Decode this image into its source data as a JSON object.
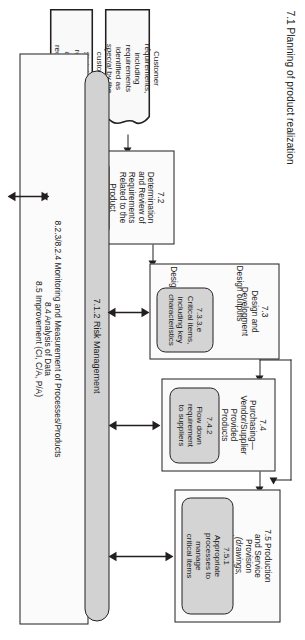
{
  "diagram": {
    "title": "7.1 Planning of product realization",
    "orientation": "rotated-90-clockwise",
    "stages": {
      "design_inputs_label": "Design inputs",
      "design_outputs_label": "Design outputs"
    },
    "boxes": {
      "production": {
        "id": "7.5",
        "title_line1": "7.5 Production",
        "title_line2": "and Service",
        "title_line3": "Provision",
        "note_line1": "(drawings,",
        "note_line2": "instructions,",
        "note_line3": "plans, etc.)",
        "inner": {
          "id": "7.5.1",
          "line1": "Appropriate",
          "line2": "processes to",
          "line3": "manage",
          "line4": "critical items"
        }
      },
      "purchasing": {
        "id": "7.4",
        "title_line1": "7.4",
        "title_line2": "Purchasing—",
        "title_line3": "Vendor/Supplier",
        "title_line4": "Provided",
        "title_line5": "Products",
        "inner": {
          "id": "7.4.2",
          "line1": "Flow down",
          "line2": "requirement",
          "line3": "to suppliers"
        }
      },
      "design": {
        "id": "7.3",
        "title_line1": "7.3",
        "title_line2": "Design and",
        "title_line3": "Development",
        "inner": {
          "id": "7.3.3.e",
          "line1": "Critical items,",
          "line2": "including key",
          "line3": "characteristics"
        }
      },
      "requirements": {
        "id": "7.2",
        "title_line1": "7.2",
        "title_line2": "Determination",
        "title_line3": "and Review of",
        "title_line4": "Requirements",
        "title_line5": "Related to the",
        "title_line6": "Product",
        "inner": {
          "line1": "Special",
          "line2": "requirements",
          "line3": "as determined",
          "line4": "by customer or",
          "line5": "organization"
        }
      }
    },
    "documents": [
      {
        "name": "customer-requirements",
        "line1": "Customer",
        "line2": "requirements,",
        "line3": "including",
        "line4": "requirements",
        "line5": "identified as",
        "line6_italic": "special",
        "line6_rest": " by the",
        "line7": "customer"
      },
      {
        "name": "statutory-requirements",
        "line1": "Statutory,",
        "line2": "regulatory,",
        "line3": "and other",
        "line4": "requirements"
      }
    ],
    "risk_bar": {
      "label": "7.1.2 Risk Management"
    },
    "measurement_box": {
      "line1": "8.2.3/8.2.4 Monitoring and Measurement of Processes/Products",
      "line2": "8.4 Analysis of Data",
      "line3": "8.5 Improvement (CI, C/A, P/A)"
    },
    "colors": {
      "stroke": "#231f20",
      "box_fill": "#f7f7f7",
      "inner_fill": "#d4d4d4",
      "bar_fill": "#d2d2d2",
      "background": "#ffffff"
    }
  }
}
